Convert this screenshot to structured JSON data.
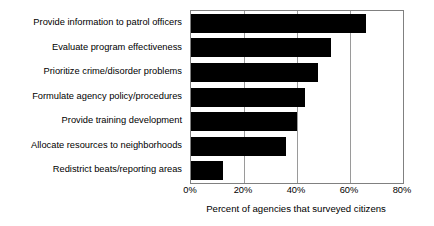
{
  "chart_data": {
    "type": "bar",
    "orientation": "horizontal",
    "title": "",
    "xlabel": "Percent of agencies that surveyed citizens",
    "ylabel": "",
    "categories": [
      "Provide information to patrol officers",
      "Evaluate program effectiveness",
      "Prioritize crime/disorder problems",
      "Formulate agency policy/procedures",
      "Provide training development",
      "Allocate resources to neighborhoods",
      "Redistrict beats/reporting areas"
    ],
    "values": [
      66,
      53,
      48,
      43,
      40,
      36,
      12
    ],
    "xlim": [
      0,
      80
    ],
    "xticks": [
      0,
      20,
      40,
      60,
      80
    ],
    "xtick_labels": [
      "0%",
      "20%",
      "40%",
      "60%",
      "80%"
    ],
    "grid": "vertical",
    "legend": "none",
    "bar_color": "#000000",
    "plot_border_color": "#808080",
    "background_color": "#ffffff"
  }
}
